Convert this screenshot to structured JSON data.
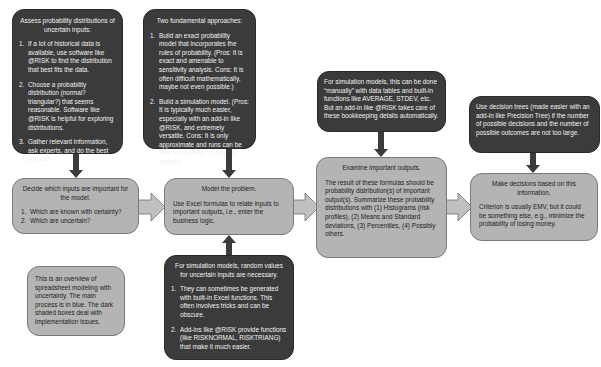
{
  "diagram": {
    "colors": {
      "dark_box": "#3b3b3b",
      "process_box": "#b4b4b4",
      "arrow": "#3b3b3b",
      "block_arrow_fill": "#c0c0c0"
    },
    "implementation_boxes": {
      "assess": {
        "title": "Assess probability distributions of uncertain inputs:",
        "items": [
          {
            "n": "1.",
            "text": "If a lot of historical data is available, use software like @RISK to find the distribution that best fits the data."
          },
          {
            "n": "2.",
            "text": "Choose a probability distribution (normal? triangular?) that seems reasonable. Software like @RISK is helpful for exploring distributions."
          },
          {
            "n": "3.",
            "text": "Gather relevant information, ask experts, and do the best you can."
          }
        ]
      },
      "approaches": {
        "title": "Two fundamental approaches:",
        "items": [
          {
            "n": "1.",
            "text": "Build an exact probability model that incorporates the rules of probability. (Pros: It is exact and amenable to sensitivity analysis. Cons: It is often difficult mathematically, maybe not even possible.)"
          },
          {
            "n": "2.",
            "text": "Build a simulation model. (Pros: It is typically much easier, especially with an add-in like @RISK, and extremely versatile. Cons: It is only approximate and runs can be time consuming for complex models)."
          }
        ]
      },
      "bookkeeping": {
        "text": "For simulation models, this can be done “manually” with data tables and built-in functions like AVERAGE, STDEV, etc. But an add-in like @RISK takes care of these bookkeeping details automatically."
      },
      "decision_trees": {
        "text": "Use decision trees (made easier with an add-in like Precision Tree) if the number of possible decisions and the number of possible outcomes are not too large."
      },
      "random_values": {
        "title": "For simulation models, random values for uncertain inputs are necessary.",
        "items": [
          {
            "n": "1.",
            "text": "They can sometimes be generated with built-in Excel functions. This often involves tricks and can be obscure."
          },
          {
            "n": "2.",
            "text": "Add-ins like @RISK provide functions (like RISKNORMAL, RISKTRIANG) that make it much easier."
          }
        ]
      }
    },
    "process_boxes": {
      "decide": {
        "title": "Decide which inputs are important for the model.",
        "items": [
          {
            "n": "1.",
            "text": "Which are known with certainty?"
          },
          {
            "n": "2.",
            "text": "Which are uncertain?"
          }
        ]
      },
      "model": {
        "title": "Model the problem.",
        "text": "Use Excel formulas to relate inputs to important outputs, i.e., enter the business logic."
      },
      "examine": {
        "title": "Examine important outputs.",
        "text": "The result of these formulas should be probability distribution(s) of important output(s). Summarize these probability distributions with (1) Histograms (risk profiles), (2) Means and Standard deviations, (3) Percentiles, (4) Possibly others."
      },
      "decisions": {
        "title": "Make decisions based on this information.",
        "text": "Criterion is usually EMV, but it could be something else, e.g., minimize the probability of losing money."
      }
    },
    "note": {
      "text": "This is an overview of spreadsheet modeling with uncertainty. The main process is in blue. The dark shaded boxes deal with implementation issues."
    },
    "credit": "© Cengage Learning"
  }
}
